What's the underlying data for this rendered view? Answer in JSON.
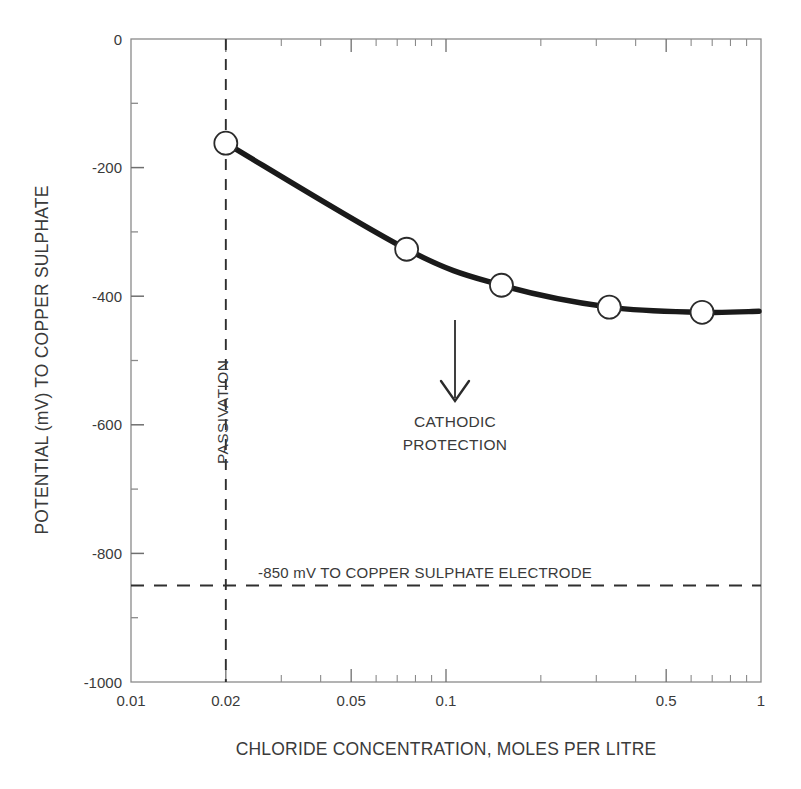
{
  "chart_data": {
    "type": "line",
    "title": "",
    "xlabel": "CHLORIDE CONCENTRATION, MOLES PER LITRE",
    "ylabel": "POTENTIAL (mV) TO COPPER SULPHATE",
    "xscale": "log",
    "xlim": [
      0.01,
      1
    ],
    "ylim": [
      -1000,
      0
    ],
    "grid": false,
    "legend": null,
    "x_ticks_labeled": [
      {
        "value": 0.01,
        "label": "0.01"
      },
      {
        "value": 0.02,
        "label": "0.02"
      },
      {
        "value": 0.05,
        "label": "0.05"
      },
      {
        "value": 0.1,
        "label": "0.1"
      },
      {
        "value": 0.5,
        "label": "0.5"
      },
      {
        "value": 1,
        "label": "1"
      }
    ],
    "x_ticks_minor": [
      0.03,
      0.04,
      0.06,
      0.07,
      0.08,
      0.09,
      0.2,
      0.3,
      0.4,
      0.6,
      0.7,
      0.8,
      0.9
    ],
    "y_ticks_major": [
      {
        "value": 0,
        "label": "0"
      },
      {
        "value": -200,
        "label": "-200"
      },
      {
        "value": -400,
        "label": "-400"
      },
      {
        "value": -600,
        "label": "-600"
      },
      {
        "value": -800,
        "label": "-800"
      },
      {
        "value": -1000,
        "label": "-1000"
      }
    ],
    "y_ticks_minor": [
      -100,
      -300,
      -500,
      -700,
      -900
    ],
    "series": [
      {
        "name": "potential-vs-chloride",
        "marker": "open-circle",
        "points": [
          {
            "x": 0.02,
            "y": -162
          },
          {
            "x": 0.075,
            "y": -327
          },
          {
            "x": 0.15,
            "y": -383
          },
          {
            "x": 0.33,
            "y": -417
          },
          {
            "x": 0.65,
            "y": -425
          }
        ]
      }
    ],
    "reference_lines": [
      {
        "name": "passivation-line",
        "orientation": "vertical",
        "value": 0.02,
        "style": "dashed",
        "label": "PASSIVATION"
      },
      {
        "name": "cathodic-protection-criterion",
        "orientation": "horizontal",
        "value": -850,
        "style": "dashed",
        "label": "-850 mV TO COPPER SULPHATE ELECTRODE"
      }
    ],
    "annotations": [
      {
        "name": "cathodic-protection-annotation",
        "text_lines": [
          "CATHODIC",
          "PROTECTION"
        ],
        "arrow": {
          "from": {
            "x": 0.1,
            "y": -280
          },
          "to": {
            "x": 0.1,
            "y": -560
          },
          "direction": "down"
        }
      }
    ],
    "colors": {
      "line": "#1a1a1a",
      "marker_face": "#ffffff",
      "marker_edge": "#2b2b2b",
      "axis": "#8a8a8a",
      "text": "#3a3a3a",
      "background": "#ffffff"
    }
  }
}
